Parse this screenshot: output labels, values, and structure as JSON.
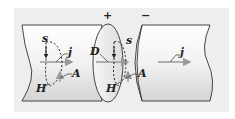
{
  "diagram": {
    "signs": {
      "plus": "+",
      "minus": "−"
    },
    "labels": {
      "left_s": "s",
      "left_j": "j",
      "left_A": "A",
      "left_H": "H",
      "mid_D": "D",
      "mid_s": "s",
      "mid_A": "A",
      "mid_H": "H",
      "right_j": "j"
    },
    "colors": {
      "background": "#eeeeee",
      "cylinder_fill": "#f4f4f4",
      "cylinder_shade": "#d8d8d8",
      "outline": "#333333",
      "arrow": "#9a9a9a"
    }
  }
}
